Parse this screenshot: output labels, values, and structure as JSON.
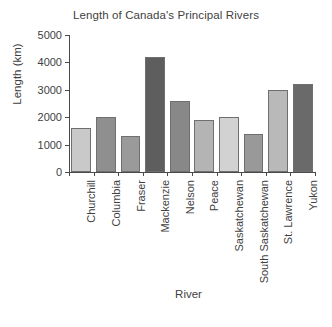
{
  "chart_data": {
    "type": "bar",
    "title": "Length of Canada's Principal Rivers",
    "xlabel": "River",
    "ylabel": "Length (km)",
    "categories": [
      "Churchill",
      "Columbia",
      "Fraser",
      "Mackenzie",
      "Nelson",
      "Peace",
      "Saskatchewan",
      "South Saskatchewan",
      "St. Lawrence",
      "Yukon"
    ],
    "values": [
      1600,
      2000,
      1300,
      4200,
      2600,
      1900,
      2000,
      1400,
      3000,
      3200
    ],
    "bar_colors": [
      "#c9c9c9",
      "#8f8f8f",
      "#9a9a9a",
      "#5e5e5e",
      "#888888",
      "#b4b4b4",
      "#d2d2d2",
      "#999999",
      "#b9b9b9",
      "#6a6a6a"
    ],
    "ylim": [
      0,
      5000
    ],
    "yticks": [
      0,
      1000,
      2000,
      3000,
      4000,
      5000
    ],
    "ytick_labels": [
      "0",
      "1000",
      "2000",
      "3000",
      "4000",
      "5000"
    ],
    "grid": false,
    "legend": "none",
    "axis_color": "#4a4a4a",
    "bar_edge_color": "#6f6f6f",
    "text_color": "#3f3f3f",
    "background": "#ffffff"
  }
}
